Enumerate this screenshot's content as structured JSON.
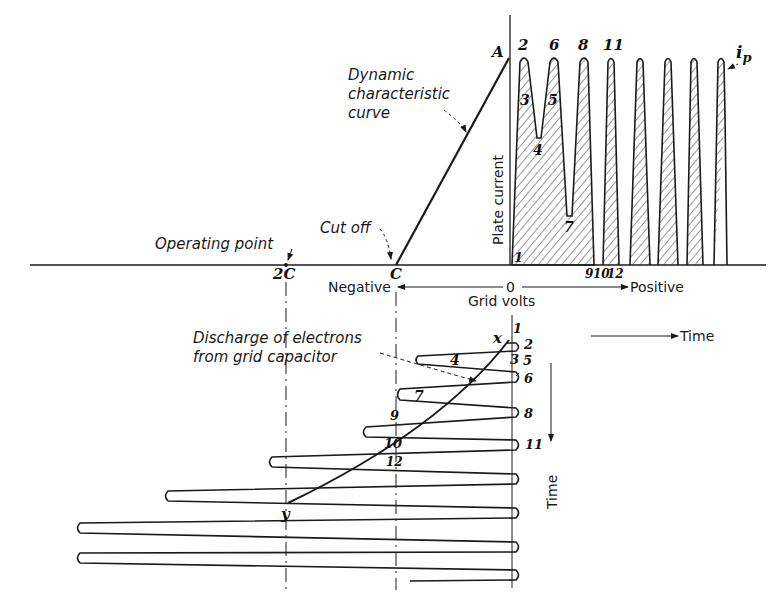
{
  "figure": {
    "annotations": {
      "dynamic_curve": [
        "Dynamic",
        "characteristic",
        "curve"
      ],
      "cut_off": "Cut off",
      "operating_point": "Operating point",
      "discharge": [
        "Discharge of electrons",
        "from grid capacitor"
      ],
      "plate_current": "Plate current",
      "ip": "i",
      "ip_sub": "p"
    },
    "axis": {
      "zero": "0",
      "grid_volts": "Grid volts",
      "negative": "Negative",
      "positive": "Positive",
      "time_horizontal": "Time",
      "time_vertical": "Time"
    },
    "points": {
      "A": "A",
      "C": "C",
      "two_C": "2C",
      "x": "x",
      "y": "y"
    },
    "plate_labels": {
      "p1": "1",
      "p2": "2",
      "p3": "3",
      "p4": "4",
      "p5": "5",
      "p6": "6",
      "p7": "7",
      "p8": "8",
      "p9": "9",
      "p10": "10",
      "p11": "11",
      "p12": "12"
    },
    "grid_labels": {
      "g1": "1",
      "g2": "2",
      "g3": "3",
      "g4": "4",
      "g5": "5",
      "g6": "6",
      "g7": "7",
      "g8": "8",
      "g9": "9",
      "g10": "10",
      "g11": "11",
      "g12": "12"
    }
  }
}
